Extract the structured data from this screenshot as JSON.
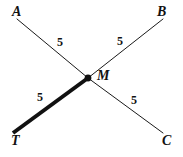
{
  "figure": {
    "type": "geometry-diagram",
    "background_color": "#ffffff",
    "stroke_color": "#1a1a1a",
    "thin_stroke_width": 1,
    "thick_stroke_width": 4,
    "points": [
      {
        "id": "A",
        "label": "A",
        "x": 17,
        "y": 19
      },
      {
        "id": "B",
        "label": "B",
        "x": 163,
        "y": 19
      },
      {
        "id": "M",
        "label": "M",
        "x": 88,
        "y": 78
      },
      {
        "id": "T",
        "label": "T",
        "x": 13,
        "y": 133
      },
      {
        "id": "C",
        "label": "C",
        "x": 163,
        "y": 133
      }
    ],
    "vertex_marker": {
      "id": "M",
      "shape": "filled-circle",
      "x": 88,
      "y": 78,
      "radius": 3.4
    },
    "segments": [
      {
        "id": "A-M",
        "from": "A",
        "to": "M",
        "weight": "thin",
        "length_label": "5"
      },
      {
        "id": "M-C",
        "from": "M",
        "to": "C",
        "weight": "thin",
        "length_label": "5"
      },
      {
        "id": "B-M",
        "from": "B",
        "to": "M",
        "weight": "thin",
        "length_label": "5"
      },
      {
        "id": "M-T",
        "from": "M",
        "to": "T",
        "weight": "thick",
        "length_label": "5"
      }
    ],
    "length_labels": {
      "top_left": "5",
      "top_right": "5",
      "bottom_left": "5",
      "bottom_right": "5"
    }
  }
}
